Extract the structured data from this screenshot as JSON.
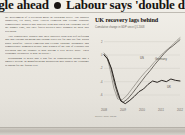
{
  "headline": {
    "text_before_bullet": "ggle ahead",
    "bullet_icon": "bullet-dot",
    "text_after_bullet": "Labour says 'double dip' made"
  },
  "article": {
    "paragraphs": [
      "the government of a recession made in Downing Street. The shadow chancellor, Ed Balls, said: \"David Cameron and George Osborne complacently boasted that austerity plan had taken our economy out of the danger zone, but they failed policies have plunged us back into recession.",
      "\"We consistently warned that their austerity plan was self-defeating and that cutting spending and raising taxes too far and too fast would badly backfire. David Cameron and George Osborne arrogantly and complacently dismissed people who warned of the risk of a double-dip recession and the country is now paying a very heavy price. Their economic credibility is now in tatters.\"",
      "Responding to news that a big fall in construction output and a smaller decline in manufacturing production had caused the economy to shrink for the fourth year"
    ]
  },
  "chart_data": {
    "type": "line",
    "title": "UK recovery lags behind",
    "subtitle": "Cumulative change in GDP since Q1 2008",
    "source": "Source: ONS, OECD",
    "xlabel": "",
    "ylabel": "%",
    "xtick_labels": [
      "2008",
      "2009",
      "2010",
      "2011",
      "2012"
    ],
    "ytick_labels": [
      "2",
      "0",
      "-2",
      "-4",
      "-6"
    ],
    "ylim": [
      -7.5,
      3.0
    ],
    "grid": true,
    "legend_position": "inline",
    "series": [
      {
        "name": "Germany",
        "color": "#8c8880",
        "label_x": 60,
        "label_y": 27,
        "x": [
          0,
          4,
          8,
          13,
          18,
          24,
          30,
          36,
          42,
          48,
          54,
          60,
          66,
          72,
          78,
          84,
          90,
          96,
          100
        ],
        "values": [
          0.3,
          -0.2,
          -2.2,
          -5.0,
          -6.6,
          -6.7,
          -6.1,
          -5.2,
          -4.3,
          -3.4,
          -2.6,
          -1.9,
          -1.1,
          -0.4,
          0.3,
          0.9,
          1.5,
          2.2,
          2.6
        ]
      },
      {
        "name": "US",
        "color": "#4a443e",
        "label_x": 45,
        "label_y": 26,
        "x": [
          0,
          4,
          9,
          14,
          19,
          25,
          31,
          37,
          43,
          49,
          55,
          61,
          67,
          73,
          79,
          85,
          91,
          97,
          100
        ],
        "values": [
          0.1,
          -0.5,
          -1.9,
          -4.4,
          -6.3,
          -7.1,
          -6.6,
          -5.8,
          -4.9,
          -4.0,
          -3.1,
          -2.3,
          -1.4,
          -0.6,
          0.2,
          0.9,
          1.4,
          2.0,
          2.3
        ]
      },
      {
        "name": "UK",
        "color": "#2b2622",
        "label_x": 72,
        "label_y": 55,
        "x": [
          0,
          5,
          10,
          16,
          22,
          28,
          34,
          40,
          46,
          52,
          58,
          64,
          70,
          76,
          82,
          88,
          94,
          100
        ],
        "values": [
          0.0,
          -0.6,
          -2.1,
          -4.8,
          -6.9,
          -7.3,
          -6.8,
          -6.2,
          -5.5,
          -5.1,
          -4.4,
          -3.9,
          -4.1,
          -3.8,
          -4.0,
          -3.6,
          -3.8,
          -3.9
        ]
      }
    ]
  }
}
